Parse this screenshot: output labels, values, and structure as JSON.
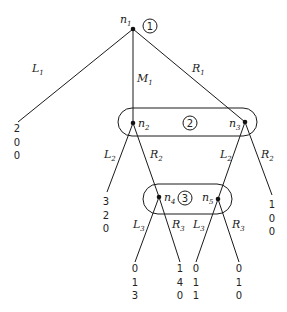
{
  "diagram": {
    "type": "extensive-form game tree",
    "colors": {
      "line": "#1a1a1a",
      "node": "#111111",
      "background": "#ffffff"
    },
    "nodes": [
      {
        "id": "n1",
        "label": "n",
        "sub": "1",
        "x": 133,
        "y": 29,
        "lx": 120,
        "ly": 23
      },
      {
        "id": "n2",
        "label": "n",
        "sub": "2",
        "x": 133,
        "y": 123,
        "lx": 138,
        "ly": 127
      },
      {
        "id": "n3",
        "label": "n",
        "sub": "3",
        "x": 245,
        "y": 122,
        "lx": 229,
        "ly": 127
      },
      {
        "id": "n4",
        "label": "n",
        "sub": "4",
        "x": 159,
        "y": 197,
        "lx": 164,
        "ly": 201
      },
      {
        "id": "n5",
        "label": "n",
        "sub": "5",
        "x": 218,
        "y": 199,
        "lx": 202,
        "ly": 201
      }
    ],
    "players": [
      {
        "label": "1",
        "cx": 150,
        "cy": 26,
        "r": 7
      },
      {
        "label": "2",
        "cx": 190,
        "cy": 123,
        "r": 7
      },
      {
        "label": "3",
        "cx": 185,
        "cy": 198,
        "r": 7
      }
    ],
    "information_sets": [
      {
        "player": "2",
        "x": 118,
        "y": 108,
        "w": 139,
        "h": 28,
        "r": 14
      },
      {
        "player": "3",
        "x": 143,
        "y": 184,
        "w": 89,
        "h": 30,
        "r": 15
      }
    ],
    "edges": [
      {
        "from": "n1",
        "x1": 133,
        "y1": 29,
        "x2": 18,
        "y2": 122,
        "label": "L",
        "sub": "1",
        "lx": 32,
        "ly": 72
      },
      {
        "from": "n1",
        "x1": 133,
        "y1": 29,
        "x2": 133,
        "y2": 123,
        "label": "M",
        "sub": "1",
        "lx": 137,
        "ly": 82
      },
      {
        "from": "n1",
        "x1": 133,
        "y1": 29,
        "x2": 245,
        "y2": 122,
        "label": "R",
        "sub": "1",
        "lx": 192,
        "ly": 72
      },
      {
        "from": "n2",
        "x1": 133,
        "y1": 123,
        "x2": 107,
        "y2": 192,
        "label": "L",
        "sub": "2",
        "lx": 104,
        "ly": 158
      },
      {
        "from": "n2",
        "x1": 133,
        "y1": 123,
        "x2": 159,
        "y2": 197,
        "label": "R",
        "sub": "2",
        "lx": 150,
        "ly": 158
      },
      {
        "from": "n3",
        "x1": 245,
        "y1": 122,
        "x2": 218,
        "y2": 199,
        "label": "L",
        "sub": "2",
        "lx": 220,
        "ly": 158
      },
      {
        "from": "n3",
        "x1": 245,
        "y1": 122,
        "x2": 272,
        "y2": 195,
        "label": "R",
        "sub": "2",
        "lx": 261,
        "ly": 158
      },
      {
        "from": "n4",
        "x1": 159,
        "y1": 197,
        "x2": 135,
        "y2": 262,
        "label": "L",
        "sub": "3",
        "lx": 133,
        "ly": 228
      },
      {
        "from": "n4",
        "x1": 159,
        "y1": 197,
        "x2": 180,
        "y2": 262,
        "label": "R",
        "sub": "3",
        "lx": 172,
        "ly": 228
      },
      {
        "from": "n5",
        "x1": 218,
        "y1": 199,
        "x2": 196,
        "y2": 262,
        "label": "L",
        "sub": "3",
        "lx": 193,
        "ly": 228
      },
      {
        "from": "n5",
        "x1": 218,
        "y1": 199,
        "x2": 239,
        "y2": 262,
        "label": "R",
        "sub": "3",
        "lx": 232,
        "ly": 228
      }
    ],
    "payoffs": [
      {
        "leaf": "L1",
        "x": 17,
        "y": 132,
        "values": [
          "2",
          "0",
          "0"
        ]
      },
      {
        "leaf": "M1-L2",
        "x": 106,
        "y": 205,
        "values": [
          "3",
          "2",
          "0"
        ]
      },
      {
        "leaf": "R1-R2",
        "x": 272,
        "y": 208,
        "values": [
          "1",
          "0",
          "0"
        ]
      },
      {
        "leaf": "n4-L3",
        "x": 135,
        "y": 272,
        "values": [
          "0",
          "1",
          "3"
        ]
      },
      {
        "leaf": "n4-R3",
        "x": 180,
        "y": 272,
        "values": [
          "1",
          "4",
          "0"
        ]
      },
      {
        "leaf": "n5-L3",
        "x": 196,
        "y": 272,
        "values": [
          "0",
          "1",
          "1"
        ]
      },
      {
        "leaf": "n5-R3",
        "x": 239,
        "y": 272,
        "values": [
          "0",
          "1",
          "0"
        ]
      }
    ]
  }
}
